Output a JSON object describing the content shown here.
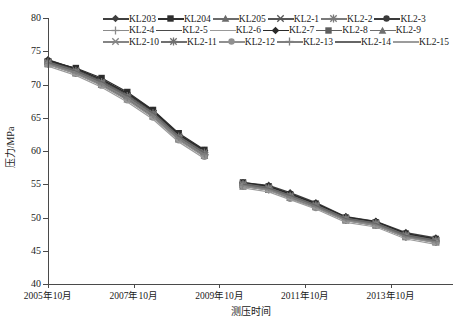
{
  "chart_data": {
    "type": "line",
    "title": "",
    "xlabel": "测压时间",
    "ylabel": "压力/MPa",
    "ylim": [
      40,
      80
    ],
    "yticks": [
      40,
      45,
      50,
      55,
      60,
      65,
      70,
      75,
      80
    ],
    "xticks": [
      "2005年10月",
      "2007年10月",
      "2009年10月",
      "2011年10月",
      "2013年10月"
    ],
    "xtick_values": [
      2005.75,
      2007.75,
      2009.75,
      2011.75,
      2013.75
    ],
    "xlim": [
      2005.75,
      2015.2
    ],
    "grid": false,
    "legend_position": "top",
    "x": [
      2005.75,
      2006.4,
      2007.0,
      2007.6,
      2008.2,
      2008.8,
      2009.4,
      2010.3,
      2010.9,
      2011.4,
      2012.0,
      2012.7,
      2013.4,
      2014.1,
      2014.8
    ],
    "series": [
      {
        "name": "KL203",
        "color": "#404040",
        "marker": "diamond",
        "values": [
          73.6,
          72.2,
          70.6,
          68.5,
          65.9,
          62.3,
          59.9,
          55.1,
          54.7,
          53.6,
          52.1,
          50.0,
          49.3,
          47.6,
          46.8
        ]
      },
      {
        "name": "KL204",
        "color": "#2e2e2e",
        "marker": "square",
        "values": [
          73.4,
          72.4,
          70.9,
          68.8,
          66.1,
          62.6,
          60.1,
          55.2,
          54.6,
          53.4,
          52.0,
          49.9,
          49.2,
          47.5,
          46.7
        ]
      },
      {
        "name": "KL205",
        "color": "#6b6b6b",
        "marker": "triangle",
        "values": [
          73.3,
          72.0,
          70.3,
          68.2,
          65.6,
          62.1,
          59.6,
          55.0,
          54.4,
          53.2,
          51.8,
          49.8,
          49.1,
          47.3,
          46.5
        ]
      },
      {
        "name": "KL2-1",
        "color": "#555555",
        "marker": "x",
        "values": [
          73.5,
          72.1,
          70.4,
          68.3,
          65.7,
          62.2,
          59.7,
          55.0,
          54.5,
          53.3,
          51.9,
          49.9,
          49.2,
          47.4,
          46.6
        ]
      },
      {
        "name": "KL2-2",
        "color": "#7a7a7a",
        "marker": "star",
        "values": [
          73.2,
          71.9,
          70.2,
          68.0,
          65.4,
          62.0,
          59.5,
          54.9,
          54.3,
          53.1,
          51.7,
          49.7,
          49.0,
          47.2,
          46.4
        ]
      },
      {
        "name": "KL2-3",
        "color": "#3a3a3a",
        "marker": "circle",
        "values": [
          73.6,
          72.3,
          70.7,
          68.6,
          66.0,
          62.4,
          60.0,
          55.1,
          54.6,
          53.5,
          52.0,
          50.0,
          49.3,
          47.5,
          46.7
        ]
      },
      {
        "name": "KL2-4",
        "color": "#8a8a8a",
        "marker": "plus",
        "values": [
          73.1,
          71.7,
          70.0,
          67.8,
          65.2,
          61.8,
          59.3,
          54.8,
          54.2,
          53.0,
          51.6,
          49.6,
          48.9,
          47.1,
          46.3
        ]
      },
      {
        "name": "KL2-5",
        "color": "#4a4a4a",
        "marker": "none",
        "values": [
          73.4,
          72.0,
          70.4,
          68.3,
          65.7,
          62.2,
          59.8,
          55.0,
          54.5,
          53.3,
          51.9,
          49.9,
          49.1,
          47.4,
          46.6
        ]
      },
      {
        "name": "KL2-6",
        "color": "#999999",
        "marker": "none",
        "values": [
          73.0,
          71.6,
          69.9,
          67.7,
          65.1,
          61.7,
          59.2,
          54.7,
          54.1,
          52.9,
          51.5,
          49.5,
          48.8,
          47.0,
          46.2
        ]
      },
      {
        "name": "KL2-7",
        "color": "#2a2a2a",
        "marker": "diamond",
        "values": [
          73.7,
          72.4,
          70.8,
          68.7,
          66.1,
          62.5,
          60.1,
          55.2,
          54.7,
          53.6,
          52.1,
          50.1,
          49.4,
          47.6,
          46.8
        ]
      },
      {
        "name": "KL2-8",
        "color": "#5e5e5e",
        "marker": "square",
        "values": [
          73.3,
          71.9,
          70.3,
          68.1,
          65.5,
          62.0,
          59.6,
          54.9,
          54.4,
          53.2,
          51.8,
          49.8,
          49.0,
          47.3,
          46.5
        ]
      },
      {
        "name": "KL2-9",
        "color": "#6f6f6f",
        "marker": "triangle",
        "values": [
          73.2,
          71.8,
          70.1,
          67.9,
          65.3,
          61.9,
          59.4,
          54.8,
          54.3,
          53.1,
          51.7,
          49.7,
          48.9,
          47.2,
          46.4
        ]
      },
      {
        "name": "KL2-10",
        "color": "#858585",
        "marker": "x",
        "values": [
          73.1,
          71.7,
          70.0,
          67.9,
          65.2,
          61.8,
          59.3,
          54.8,
          54.2,
          53.0,
          51.6,
          49.6,
          48.9,
          47.1,
          46.3
        ]
      },
      {
        "name": "KL2-11",
        "color": "#707070",
        "marker": "star",
        "values": [
          73.3,
          72.0,
          70.3,
          68.2,
          65.6,
          62.1,
          59.7,
          55.0,
          54.4,
          53.2,
          51.8,
          49.8,
          49.1,
          47.3,
          46.5
        ]
      },
      {
        "name": "KL2-12",
        "color": "#909090",
        "marker": "circle",
        "values": [
          73.0,
          71.6,
          69.8,
          67.6,
          65.0,
          61.6,
          59.1,
          54.7,
          54.1,
          52.8,
          51.4,
          49.5,
          48.8,
          47.0,
          46.2
        ]
      },
      {
        "name": "KL2-13",
        "color": "#7f7f7f",
        "marker": "plus",
        "values": [
          73.2,
          71.8,
          70.1,
          68.0,
          65.4,
          61.9,
          59.5,
          54.9,
          54.3,
          53.1,
          51.7,
          49.7,
          49.0,
          47.2,
          46.4
        ]
      },
      {
        "name": "KL2-14",
        "color": "#666666",
        "marker": "none",
        "values": [
          73.4,
          72.1,
          70.5,
          68.4,
          65.8,
          62.3,
          59.8,
          55.1,
          54.5,
          53.4,
          51.9,
          49.9,
          49.2,
          47.4,
          46.6
        ]
      },
      {
        "name": "KL2-15",
        "color": "#9c9c9c",
        "marker": "none",
        "values": [
          72.9,
          71.5,
          69.7,
          67.5,
          64.9,
          61.5,
          59.0,
          54.6,
          54.0,
          52.8,
          51.4,
          49.4,
          48.7,
          46.9,
          46.1
        ]
      }
    ]
  },
  "axes": {
    "ylabel": "压力/MPa",
    "xlabel": "测压时间",
    "ytick_labels": [
      "40",
      "45",
      "50",
      "55",
      "60",
      "65",
      "70",
      "75",
      "80"
    ],
    "xtick_labels": [
      "2005年10月",
      "2007年10月",
      "2009年10月",
      "2011年10月",
      "2013年10月"
    ]
  },
  "legend": {
    "rows": [
      [
        "KL203",
        "KL204",
        "KL205",
        "KL2-1",
        "KL2-2",
        "KL2-3"
      ],
      [
        "KL2-4",
        "KL2-5",
        "KL2-6",
        "KL2-7",
        "KL2-8",
        "KL2-9"
      ],
      [
        "KL2-10",
        "KL2-11",
        "KL2-12",
        "KL2-13",
        "KL2-14",
        "KL2-15"
      ]
    ]
  }
}
